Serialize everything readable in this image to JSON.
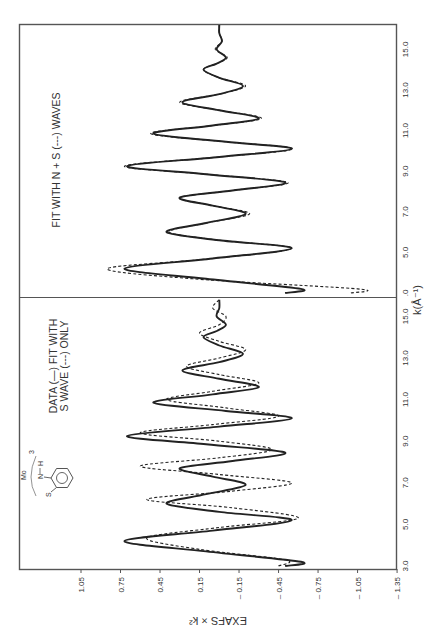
{
  "figure": {
    "orientation": "rotated-90-ccw",
    "y_axis_label": "EXAFS × k²",
    "x_axis_label": "k(Å⁻¹)"
  },
  "panels": [
    {
      "id": "lower",
      "annotation": [
        "DATA (—) FIT WITH",
        "S WAVE (---) ONLY"
      ],
      "molecule": {
        "atoms": [
          "S",
          "N",
          "H",
          "Mo"
        ],
        "subscript": "3"
      },
      "x_ticks": [
        "3.0",
        "5.0",
        "7.0",
        "9.0",
        "11.0",
        "13.0",
        "15.0"
      ]
    },
    {
      "id": "upper",
      "annotation": [
        "FIT WITH N + S (---) WAVES"
      ],
      "x_ticks": [
        ".0",
        "5.0",
        "7.0",
        "9.0",
        "11.0",
        "13.0",
        "15.0"
      ]
    }
  ],
  "y_ticks": [
    "1.05",
    "0.75",
    "0.45",
    "0.15",
    "– 0.15",
    "– 0.45",
    "– 0.75",
    "– 1.05",
    "– 1.35"
  ],
  "chart_data": [
    {
      "type": "line",
      "title": "DATA (—) FIT WITH S WAVE (---) ONLY",
      "xlabel": "k(Å⁻¹)",
      "ylabel": "EXAFS × k²",
      "xlim": [
        3.0,
        16.5
      ],
      "ylim": [
        -1.35,
        1.25
      ],
      "x_ticks": [
        3.0,
        5.0,
        7.0,
        9.0,
        11.0,
        13.0,
        15.0
      ],
      "y_ticks": [
        1.05,
        0.75,
        0.45,
        0.15,
        -0.15,
        -0.45,
        -0.75,
        -1.05,
        -1.35
      ],
      "grid": false,
      "series": [
        {
          "name": "Data",
          "style": "solid",
          "x": [
            3.0,
            3.2,
            3.7,
            4.2,
            4.7,
            5.2,
            5.6,
            6.0,
            6.45,
            6.9,
            7.3,
            7.7,
            8.05,
            8.45,
            8.85,
            9.25,
            9.7,
            10.1,
            10.45,
            10.85,
            11.25,
            11.6,
            12.0,
            12.4,
            12.8,
            13.2,
            13.6,
            14.0,
            14.3,
            14.6,
            15.0,
            15.4,
            15.8
          ],
          "y": [
            -0.5,
            -0.62,
            0.1,
            0.72,
            0.05,
            -0.55,
            0.0,
            0.4,
            0.1,
            -0.2,
            0.05,
            0.3,
            -0.1,
            -0.5,
            0.1,
            0.7,
            0.0,
            -0.55,
            -0.05,
            0.5,
            0.05,
            -0.3,
            0.0,
            0.28,
            0.0,
            -0.18,
            0.0,
            0.12,
            0.02,
            -0.05,
            0.02,
            0.0,
            0.0
          ]
        },
        {
          "name": "S wave fit",
          "style": "dashed",
          "x": [
            3.0,
            3.3,
            3.8,
            4.35,
            4.85,
            5.3,
            5.8,
            6.2,
            6.6,
            7.0,
            7.4,
            7.8,
            8.2,
            8.6,
            9.0,
            9.4,
            9.8,
            10.2,
            10.6,
            11.0,
            11.4,
            11.8,
            12.2,
            12.6,
            13.0,
            13.4,
            13.8,
            14.2,
            14.6,
            15.0,
            15.4,
            15.8
          ],
          "y": [
            -0.45,
            -0.5,
            0.15,
            0.55,
            0.0,
            -0.6,
            -0.1,
            0.55,
            -0.1,
            -0.55,
            0.0,
            0.6,
            0.0,
            -0.4,
            0.0,
            0.6,
            0.05,
            -0.45,
            -0.05,
            0.4,
            0.05,
            -0.3,
            0.0,
            0.25,
            0.0,
            -0.2,
            0.0,
            0.15,
            0.0,
            -0.05,
            0.05,
            0.0
          ]
        }
      ]
    },
    {
      "type": "line",
      "title": "FIT WITH N + S (---) WAVES",
      "xlabel": "k(Å⁻¹)",
      "ylabel": "EXAFS × k²",
      "xlim": [
        3.0,
        16.5
      ],
      "ylim": [
        -1.35,
        1.25
      ],
      "x_ticks": [
        3.0,
        5.0,
        7.0,
        9.0,
        11.0,
        13.0,
        15.0
      ],
      "y_ticks": [
        1.05,
        0.75,
        0.45,
        0.15,
        -0.15,
        -0.45,
        -0.75,
        -1.05,
        -1.35
      ],
      "grid": false,
      "series": [
        {
          "name": "Data",
          "style": "solid",
          "x": [
            3.0,
            3.2,
            3.7,
            4.2,
            4.7,
            5.2,
            5.6,
            6.0,
            6.45,
            6.9,
            7.3,
            7.7,
            8.05,
            8.45,
            8.85,
            9.25,
            9.7,
            10.1,
            10.45,
            10.85,
            11.25,
            11.6,
            12.0,
            12.4,
            12.8,
            13.2,
            13.6,
            14.0,
            14.3,
            14.6,
            15.0,
            15.4,
            15.8,
            16.2
          ],
          "y": [
            -0.5,
            -0.62,
            0.1,
            0.72,
            0.05,
            -0.55,
            0.0,
            0.4,
            0.1,
            -0.2,
            0.05,
            0.3,
            -0.1,
            -0.5,
            0.1,
            0.7,
            0.0,
            -0.55,
            -0.05,
            0.5,
            0.05,
            -0.3,
            0.0,
            0.28,
            0.0,
            -0.18,
            0.0,
            0.12,
            0.02,
            -0.05,
            0.02,
            -0.02,
            0.0,
            0.0
          ]
        },
        {
          "name": "N + S wave fit",
          "style": "dashed",
          "x": [
            3.0,
            3.2,
            3.7,
            4.2,
            4.7,
            5.2,
            5.6,
            6.0,
            6.45,
            6.9,
            7.3,
            7.7,
            8.05,
            8.45,
            8.85,
            9.25,
            9.7,
            10.1,
            10.45,
            10.85,
            11.25,
            11.6,
            12.0,
            12.4,
            12.8,
            13.2,
            13.6,
            14.0,
            14.3,
            14.6,
            15.0,
            15.4,
            15.8,
            16.2
          ],
          "y": [
            -1.0,
            -1.05,
            0.2,
            0.85,
            0.05,
            -0.55,
            0.0,
            0.38,
            0.1,
            -0.23,
            0.05,
            0.3,
            -0.1,
            -0.52,
            0.1,
            0.72,
            0.0,
            -0.56,
            -0.05,
            0.52,
            0.05,
            -0.32,
            0.0,
            0.3,
            0.0,
            -0.2,
            0.0,
            0.12,
            0.02,
            -0.06,
            0.03,
            -0.02,
            0.0,
            0.0
          ]
        }
      ]
    }
  ]
}
